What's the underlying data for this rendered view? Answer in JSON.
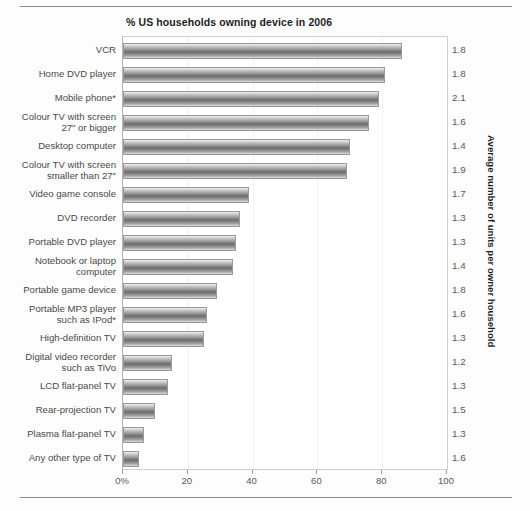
{
  "chart_data": {
    "type": "bar",
    "orientation": "horizontal",
    "title": "% US households owning device in 2006",
    "xlabel": "",
    "ylabel": "",
    "right_axis_label": "Average number of units per owner household",
    "xlim": [
      0,
      100
    ],
    "grid": false,
    "legend": null,
    "xticks": [
      0,
      20,
      40,
      60,
      80,
      100
    ],
    "xtick_labels": [
      "0%",
      "20",
      "40",
      "60",
      "80",
      "100"
    ],
    "categories": [
      "VCR",
      "Home DVD player",
      "Mobile phone*",
      "Colour TV with screen\n27″ or bigger",
      "Desktop computer",
      "Colour TV with screen\nsmaller than 27″",
      "Video game console",
      "DVD recorder",
      "Portable DVD player",
      "Notebook or laptop\ncomputer",
      "Portable game device",
      "Portable MP3 player\nsuch as IPod*",
      "High-definition TV",
      "Digital video recorder\nsuch as TiVo",
      "LCD flat-panel TV",
      "Rear-projection TV",
      "Plasma flat-panel TV",
      "Any other type of TV"
    ],
    "values": [
      86,
      81,
      79,
      76,
      70,
      69,
      39,
      36,
      35,
      34,
      29,
      26,
      25,
      15,
      14,
      10,
      6.5,
      5
    ],
    "series": [
      {
        "name": "% US households owning device in 2006",
        "values": [
          86,
          81,
          79,
          76,
          70,
          69,
          39,
          36,
          35,
          34,
          29,
          26,
          25,
          15,
          14,
          10,
          6.5,
          5
        ]
      },
      {
        "name": "Average number of units per owner household",
        "values": [
          1.8,
          1.8,
          2.1,
          1.6,
          1.4,
          1.9,
          1.7,
          1.3,
          1.3,
          1.4,
          1.8,
          1.6,
          1.3,
          1.2,
          1.3,
          1.5,
          1.3,
          1.6
        ]
      }
    ],
    "right_values": [
      "1.8",
      "1.8",
      "2.1",
      "1.6",
      "1.4",
      "1.9",
      "1.7",
      "1.3",
      "1.3",
      "1.4",
      "1.8",
      "1.6",
      "1.3",
      "1.2",
      "1.3",
      "1.5",
      "1.3",
      "1.6"
    ],
    "colors": {
      "bar_light": "#efefef",
      "bar_dark": "#6e6e6e",
      "bar_border": "#9a9a9a",
      "text": "#4a4a4a",
      "title": "#1d1d1d",
      "rule": "#8c8c8c",
      "background": "#fdfdfd"
    },
    "footnote_marker": "*"
  }
}
